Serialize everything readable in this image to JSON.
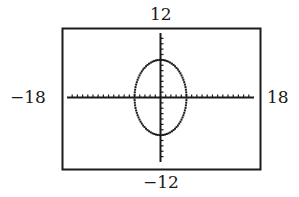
{
  "chart_data": {
    "type": "line",
    "title": "",
    "xlabel": "",
    "ylabel": "",
    "window": {
      "xmin": -18,
      "xmax": 18,
      "ymin": -12,
      "ymax": 12,
      "xscl": 1,
      "yscl": 1
    },
    "xlim": [
      -18,
      18
    ],
    "ylim": [
      -12,
      12
    ],
    "grid": false,
    "legend": null,
    "series": [
      {
        "name": "ellipse",
        "shape": "ellipse",
        "center": [
          0,
          0
        ],
        "rx": 5,
        "ry": 7,
        "style": "dotted-pixel"
      }
    ],
    "tick_labels": {
      "top": "12",
      "bottom": "−12",
      "left": "−18",
      "right": "18"
    }
  },
  "labels": {
    "ymax": "12",
    "ymin": "−12",
    "xmin": "−18",
    "xmax": "18"
  },
  "colors": {
    "ink": "#1a1a1a",
    "background": "#ffffff"
  }
}
